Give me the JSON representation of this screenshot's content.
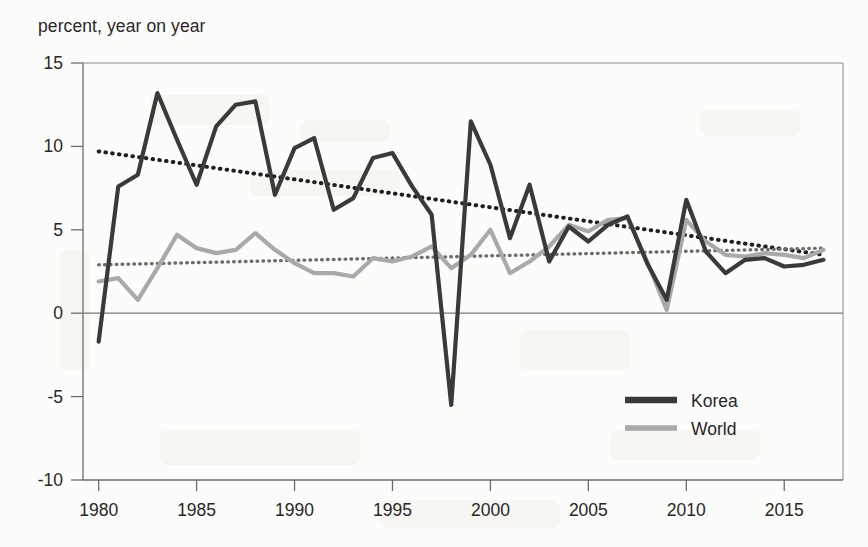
{
  "figure": {
    "axis_caption": "percent, year on year",
    "background_color": "#fcfcfb",
    "axis_color": "#6f6c6a"
  },
  "legend": {
    "position": "bottom-right",
    "entries": [
      {
        "label": "Korea",
        "color": "#3a3a3a",
        "style": "solid"
      },
      {
        "label": "World",
        "color": "#a9a9a9",
        "style": "solid"
      }
    ]
  },
  "chart_data": {
    "type": "line",
    "title": "",
    "subtitle": "",
    "xlabel": "",
    "ylabel": "percent, year on year",
    "xlim": [
      1979.2,
      1918.0
    ],
    "x_range": [
      1979.2,
      2018.0
    ],
    "ylim": [
      -10,
      15
    ],
    "grid": false,
    "y_ticks": [
      15,
      10,
      5,
      0,
      -5,
      -10
    ],
    "y_tick_labels": [
      "15",
      "10",
      "5",
      "0",
      "-5",
      "-10"
    ],
    "x_ticks": [
      1980,
      1985,
      1990,
      1995,
      2000,
      2005,
      2010,
      2015
    ],
    "x_tick_labels": [
      "1980",
      "1985",
      "1990",
      "1995",
      "2000",
      "2005",
      "2010",
      "2015"
    ],
    "x": [
      1980,
      1981,
      1982,
      1983,
      1984,
      1985,
      1986,
      1987,
      1988,
      1989,
      1990,
      1991,
      1992,
      1993,
      1994,
      1995,
      1996,
      1997,
      1998,
      1999,
      2000,
      2001,
      2002,
      2003,
      2004,
      2005,
      2006,
      2007,
      2008,
      2009,
      2010,
      2011,
      2012,
      2013,
      2014,
      2015,
      2016,
      2017
    ],
    "series": [
      {
        "name": "Korea",
        "color": "#3a3a3a",
        "style": "solid",
        "width": 4.2,
        "values": [
          -1.7,
          7.6,
          8.3,
          13.2,
          10.4,
          7.7,
          11.2,
          12.5,
          12.7,
          7.1,
          9.9,
          10.5,
          6.2,
          6.9,
          9.3,
          9.6,
          7.6,
          5.9,
          -5.5,
          11.5,
          8.9,
          4.5,
          7.7,
          3.1,
          5.2,
          4.3,
          5.3,
          5.8,
          3.0,
          0.8,
          6.8,
          3.7,
          2.4,
          3.2,
          3.3,
          2.8,
          2.9,
          3.2
        ]
      },
      {
        "name": "World",
        "color": "#a9a9a9",
        "style": "solid",
        "width": 4.2,
        "values": [
          1.9,
          2.1,
          0.8,
          2.7,
          4.7,
          3.9,
          3.6,
          3.8,
          4.8,
          3.8,
          3.0,
          2.4,
          2.4,
          2.2,
          3.3,
          3.1,
          3.4,
          4.0,
          2.7,
          3.5,
          5.0,
          2.4,
          3.1,
          4.0,
          5.3,
          4.9,
          5.6,
          5.7,
          3.1,
          0.2,
          5.6,
          4.3,
          3.5,
          3.4,
          3.6,
          3.5,
          3.3,
          3.8
        ]
      }
    ],
    "trendlines": [
      {
        "name": "Korea trend",
        "color": "#1f1f1f",
        "style": "dotted",
        "width": 4.0,
        "x": [
          1980,
          2017
        ],
        "values": [
          9.7,
          3.5
        ]
      },
      {
        "name": "World trend",
        "color": "#6e6b69",
        "style": "dotted",
        "width": 3.4,
        "x": [
          1980,
          2017
        ],
        "values": [
          2.9,
          3.9
        ]
      }
    ]
  }
}
